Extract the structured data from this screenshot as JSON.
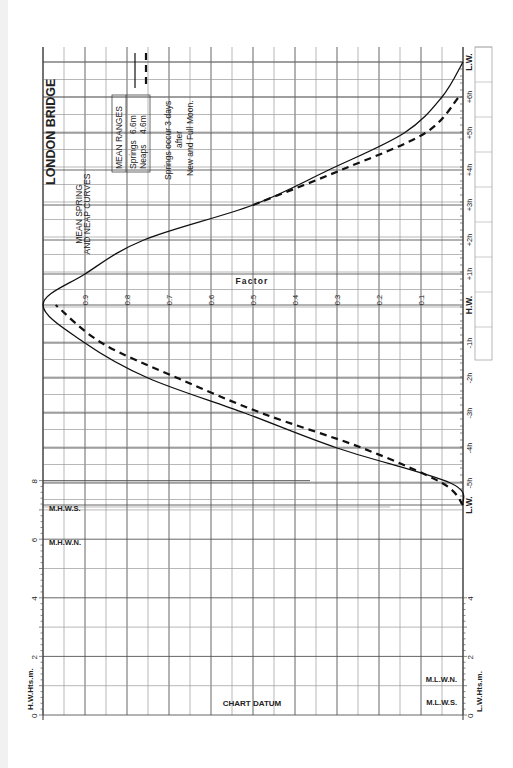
{
  "title": {
    "main": "LONDON BRIDGE",
    "subtitle_line1": "MEAN SPRING",
    "subtitle_line2": "AND NEAP CURVES"
  },
  "legend": {
    "header": "MEAN RANGES",
    "springs_label": "Springs",
    "springs_value": "6.6m",
    "neaps_label": "Neaps",
    "neaps_value": "4.6m"
  },
  "note": {
    "line1": "Springs occur 3 days",
    "line2": "after",
    "line3": "New and Full Moon."
  },
  "labels": {
    "factor": "Factor",
    "hw_axis": "H.W.Hts.m.",
    "lw_axis": "L.W.Hts.m.",
    "chart_datum": "CHART DATUM",
    "mhws": "M.H.W.S.",
    "mhwn": "M.H.W.N.",
    "mlwn": "M.L.W.N.",
    "mlws": "M.L.W.S."
  },
  "chart_data": {
    "type": "line",
    "xlabel": "Time relative to High Water (hours)",
    "ylabel": "Factor",
    "orientation": "rotated 90° (time axis vertical on right, factor axis horizontal)",
    "x": [
      "L.W.",
      "-5h",
      "-4h",
      "-3h",
      "-2h",
      "-1h",
      "H.W.",
      "+1h",
      "+2h",
      "+3h",
      "+4h",
      "+5h",
      "+6h",
      "L.W."
    ],
    "time_ticks": [
      "L.W.",
      "-5h",
      "-4h",
      "-3h",
      "-2h",
      "-1h",
      "H.W.",
      "+1h",
      "+2h",
      "+3h",
      "+4h",
      "+5h",
      "+6h",
      "L.W."
    ],
    "factor_ticks": [
      "0.9",
      "0.8",
      "0.7",
      "0.6",
      "0.5",
      "0.4",
      "0.3",
      "0.2",
      "0.1"
    ],
    "series": [
      {
        "name": "Springs (6.6m)",
        "style": "solid",
        "values": [
          0.0,
          0.03,
          0.3,
          0.52,
          0.75,
          0.9,
          1.0,
          0.9,
          0.76,
          0.5,
          0.32,
          0.14,
          0.05,
          0.0
        ]
      },
      {
        "name": "Neaps (4.6m)",
        "style": "dashed",
        "values": [
          0.0,
          0.05,
          0.24,
          0.48,
          0.68,
          0.86,
          0.97,
          null,
          null,
          0.5,
          0.29,
          0.09,
          0.01,
          null
        ]
      }
    ],
    "height_axes": {
      "left": {
        "label": "H.W.Hts.m.",
        "ticks": [
          "0",
          "2",
          "4",
          "6",
          "8"
        ],
        "range": [
          0,
          8
        ]
      },
      "right": {
        "label": "L.W.Hts.m.",
        "ticks": [
          "0",
          "2",
          "4"
        ],
        "range": [
          0,
          4
        ]
      }
    },
    "levels": {
      "M.H.W.S.": 7.1,
      "M.H.W.N.": 6.0,
      "M.L.W.N.": 1.4,
      "M.L.W.S.": 0.5,
      "CHART DATUM": 0
    },
    "legend": {
      "Springs": "6.6m",
      "Neaps": "4.6m",
      "position": "top-left"
    },
    "ylim": [
      0,
      1
    ],
    "grid": true
  }
}
